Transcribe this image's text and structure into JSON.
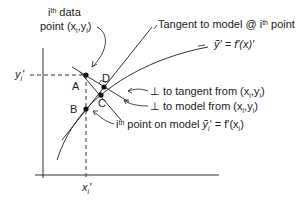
{
  "diagram": {
    "type": "geometric-regression-diagram",
    "axes": {
      "x_tick_label": "x",
      "x_tick_sub": "i",
      "y_tick_label": "y",
      "y_tick_sub": "i"
    },
    "points": {
      "A": "A",
      "B": "B",
      "C": "C",
      "D": "D"
    },
    "labels": {
      "data_point_sup": "th",
      "data_point_i": "i",
      "data_point_line1_rest": " data",
      "data_point_line2": "point (x",
      "data_point_line2_mid": ",y",
      "data_point_line2_end": ")",
      "tangent_pre": "Tangent to model @ i",
      "tangent_sup": "th",
      "tangent_post": " point",
      "tangent_eq": "ỹ' = f'(x)'",
      "perp_tangent": "⊥ to tangent from (x",
      "perp_tangent_mid": ",y",
      "perp_tangent_end": ")",
      "perp_model": "⊥ to model from (x",
      "perp_model_mid": ",y",
      "perp_model_end": ")",
      "model_point_i": "i",
      "model_point_sup": "th",
      "model_point_rest": " point on model ",
      "model_point_eq": "ỹ",
      "model_point_eq_sub": "i",
      "model_point_eq_rest": "' = f'(x",
      "model_point_eq_end": ")"
    },
    "colors": {
      "line": "#222222",
      "background": "#ffffff"
    }
  }
}
